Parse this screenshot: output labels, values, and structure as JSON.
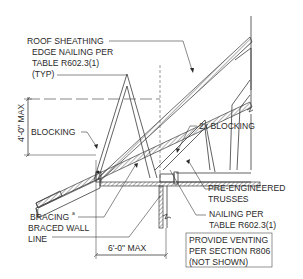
{
  "diagram": {
    "labels": {
      "roof_sheathing": [
        "ROOF SHEATHING",
        "EDGE NAILING PER",
        "TABLE R602.3(1)",
        "(TYP)"
      ],
      "blocking": "BLOCKING",
      "blocking_2x": "2x BLOCKING",
      "bracing": "BRACING",
      "bracing_superscript": "a",
      "braced_wall_line": [
        "BRACED WALL",
        "LINE"
      ],
      "pre_engineered_trusses": [
        "PRE-ENGINEERED",
        "TRUSSES"
      ],
      "nailing_per": [
        "NAILING PER",
        "TABLE R602.3(1)"
      ],
      "provide_venting": [
        "PROVIDE VENTING",
        "PER SECTION R806",
        "(NOT SHOWN)"
      ]
    },
    "dimensions": {
      "vertical": "4'-0\" MAX",
      "horizontal": "6'-0\" MAX"
    },
    "colors": {
      "line": "#3a3a3a",
      "text": "#2a2a2a",
      "background": "#ffffff"
    }
  }
}
